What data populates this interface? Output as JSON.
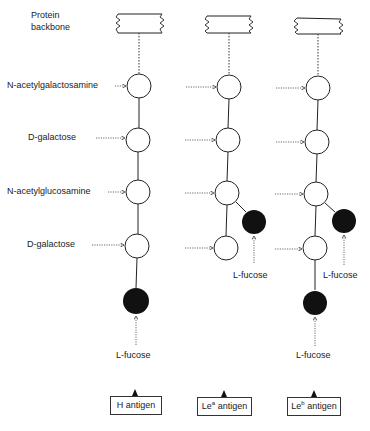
{
  "labels": {
    "protein_backbone_line1": "Protein",
    "protein_backbone_line2": "backbone",
    "sugar_1": "N-acetylgalactosamine",
    "sugar_2": "D-galactose",
    "sugar_3": "N-acetylglucosamine",
    "sugar_4": "D-galactose",
    "fucose": "L-fucose"
  },
  "columns": [
    {
      "id": "h",
      "antigen": {
        "prefix": "H",
        "superscript": "",
        "suffix": " antigen"
      },
      "fucose_labels": [
        "L-fucose"
      ]
    },
    {
      "id": "lea",
      "antigen": {
        "prefix": "Le",
        "superscript": "a",
        "suffix": " antigen"
      },
      "fucose_labels": [
        "L-fucose"
      ]
    },
    {
      "id": "leb",
      "antigen": {
        "prefix": "Le",
        "superscript": "b",
        "suffix": " antigen"
      },
      "fucose_labels": [
        "L-fucose",
        "L-fucose"
      ]
    }
  ],
  "colors": {
    "line": "#222222",
    "fucose_fill": "#111111",
    "sugar_fill": "#ffffff"
  }
}
